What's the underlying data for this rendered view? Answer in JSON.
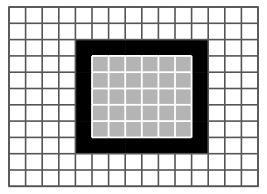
{
  "figure": {
    "title": "",
    "caption": "",
    "background_color": "#ffffff",
    "canvas_width": 267,
    "canvas_height": 194
  },
  "grid": {
    "name": "pixel-grid",
    "columns": 15,
    "rows": 11,
    "origin_x": 9,
    "origin_y": 7,
    "cell_width": 16.6,
    "cell_height": 16.3,
    "line_color": "#555555",
    "line_width": 1.6,
    "inner_line_color_over_fill": "#ffffff",
    "inner_line_width_over_fill": 1.8,
    "empty_cell_color": "#ffffff"
  },
  "shape": {
    "name": "bordered-rectangle",
    "description": "Black one-cell-thick border enclosing a light gray interior",
    "border_color": "#000000",
    "interior_color": "#b4b4b4",
    "col_start": 4,
    "col_end": 11,
    "row_start": 2,
    "row_end": 8,
    "width_cells": 8,
    "height_cells": 7,
    "interior_col_start": 5,
    "interior_col_end": 10,
    "interior_row_start": 3,
    "interior_row_end": 7,
    "interior_width_cells": 6,
    "interior_height_cells": 5,
    "border_cell_count": 26,
    "interior_cell_count": 30
  },
  "chart_data": {
    "type": "heatmap",
    "title": "",
    "xlabel": "",
    "ylabel": "",
    "grid": true,
    "legend": "none",
    "categories_x": [
      "0",
      "1",
      "2",
      "3",
      "4",
      "5",
      "6",
      "7",
      "8",
      "9",
      "10",
      "11",
      "12",
      "13",
      "14"
    ],
    "categories_y": [
      "0",
      "1",
      "2",
      "3",
      "4",
      "5",
      "6",
      "7",
      "8",
      "9",
      "10"
    ],
    "value_legend": {
      "0": "empty",
      "1": "border",
      "2": "interior"
    },
    "color_map": {
      "0": "#ffffff",
      "1": "#000000",
      "2": "#b4b4b4"
    },
    "values": [
      [
        0,
        0,
        0,
        0,
        0,
        0,
        0,
        0,
        0,
        0,
        0,
        0,
        0,
        0,
        0
      ],
      [
        0,
        0,
        0,
        0,
        0,
        0,
        0,
        0,
        0,
        0,
        0,
        0,
        0,
        0,
        0
      ],
      [
        0,
        0,
        0,
        0,
        1,
        1,
        1,
        1,
        1,
        1,
        1,
        1,
        0,
        0,
        0
      ],
      [
        0,
        0,
        0,
        0,
        1,
        2,
        2,
        2,
        2,
        2,
        2,
        1,
        0,
        0,
        0
      ],
      [
        0,
        0,
        0,
        0,
        1,
        2,
        2,
        2,
        2,
        2,
        2,
        1,
        0,
        0,
        0
      ],
      [
        0,
        0,
        0,
        0,
        1,
        2,
        2,
        2,
        2,
        2,
        2,
        1,
        0,
        0,
        0
      ],
      [
        0,
        0,
        0,
        0,
        1,
        2,
        2,
        2,
        2,
        2,
        2,
        1,
        0,
        0,
        0
      ],
      [
        0,
        0,
        0,
        0,
        1,
        2,
        2,
        2,
        2,
        2,
        2,
        1,
        0,
        0,
        0
      ],
      [
        0,
        0,
        0,
        0,
        1,
        1,
        1,
        1,
        1,
        1,
        1,
        1,
        0,
        0,
        0
      ],
      [
        0,
        0,
        0,
        0,
        0,
        0,
        0,
        0,
        0,
        0,
        0,
        0,
        0,
        0,
        0
      ],
      [
        0,
        0,
        0,
        0,
        0,
        0,
        0,
        0,
        0,
        0,
        0,
        0,
        0,
        0,
        0
      ]
    ]
  }
}
